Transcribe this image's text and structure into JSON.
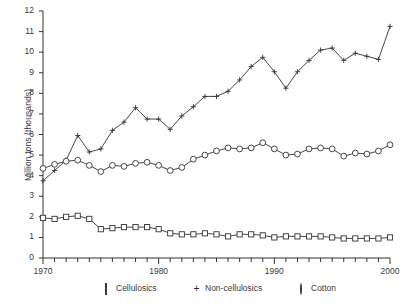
{
  "chart_data": {
    "type": "line",
    "title": "",
    "xlabel": "",
    "ylabel": "Million tons (thousands)",
    "xlim": [
      1970,
      2000
    ],
    "ylim": [
      0,
      12
    ],
    "xticks": [
      1970,
      1980,
      1990,
      2000
    ],
    "xticklabels": [
      "1970",
      "1980",
      "1990",
      "2000"
    ],
    "yticks": [
      0,
      1,
      2,
      3,
      4,
      5,
      6,
      7,
      8,
      9,
      10,
      11,
      12
    ],
    "yticklabels": [
      "0",
      "1",
      "2",
      "3",
      "4",
      "5",
      "6",
      "7",
      "8",
      "9",
      "10",
      "11",
      "12"
    ],
    "minor_xticks_every": 1,
    "grid": false,
    "legend_position": "bottom",
    "x": [
      1970,
      1971,
      1972,
      1973,
      1974,
      1975,
      1976,
      1977,
      1978,
      1979,
      1980,
      1981,
      1982,
      1983,
      1984,
      1985,
      1986,
      1987,
      1988,
      1989,
      1990,
      1991,
      1992,
      1993,
      1994,
      1995,
      1996,
      1997,
      1998,
      1999,
      2000
    ],
    "series": [
      {
        "name": "Cellulosics",
        "marker": "square",
        "values": [
          1.95,
          1.9,
          2.0,
          2.05,
          1.9,
          1.4,
          1.45,
          1.5,
          1.5,
          1.5,
          1.4,
          1.2,
          1.15,
          1.15,
          1.2,
          1.15,
          1.05,
          1.15,
          1.15,
          1.1,
          1.0,
          1.05,
          1.05,
          1.05,
          1.05,
          1.0,
          0.95,
          0.95,
          0.95,
          0.95,
          1.0
        ]
      },
      {
        "name": "Non-cellulosics",
        "marker": "plus",
        "values": [
          3.75,
          4.25,
          4.75,
          5.95,
          5.15,
          5.3,
          6.2,
          6.6,
          7.3,
          6.75,
          6.75,
          6.25,
          6.9,
          7.35,
          7.85,
          7.85,
          8.1,
          8.65,
          9.3,
          9.75,
          9.05,
          8.25,
          9.05,
          9.6,
          10.1,
          10.2,
          9.6,
          9.95,
          9.8,
          9.65,
          11.25
        ]
      },
      {
        "name": "Cotton",
        "marker": "circle",
        "values": [
          4.35,
          4.55,
          4.7,
          4.75,
          4.5,
          4.2,
          4.5,
          4.45,
          4.6,
          4.65,
          4.5,
          4.25,
          4.4,
          4.8,
          5.0,
          5.2,
          5.35,
          5.3,
          5.35,
          5.6,
          5.3,
          5.0,
          5.05,
          5.3,
          5.35,
          5.3,
          4.95,
          5.1,
          5.05,
          5.2,
          5.5
        ]
      }
    ]
  },
  "legend": {
    "items": [
      {
        "marker": "square",
        "label": "Cellulosics"
      },
      {
        "marker": "plus",
        "label": "Non-cellulosics"
      },
      {
        "marker": "circle",
        "label": "Cotton"
      }
    ]
  },
  "colors": {
    "line": "#333333",
    "text": "#3a3a3a",
    "background": "#ffffff"
  }
}
